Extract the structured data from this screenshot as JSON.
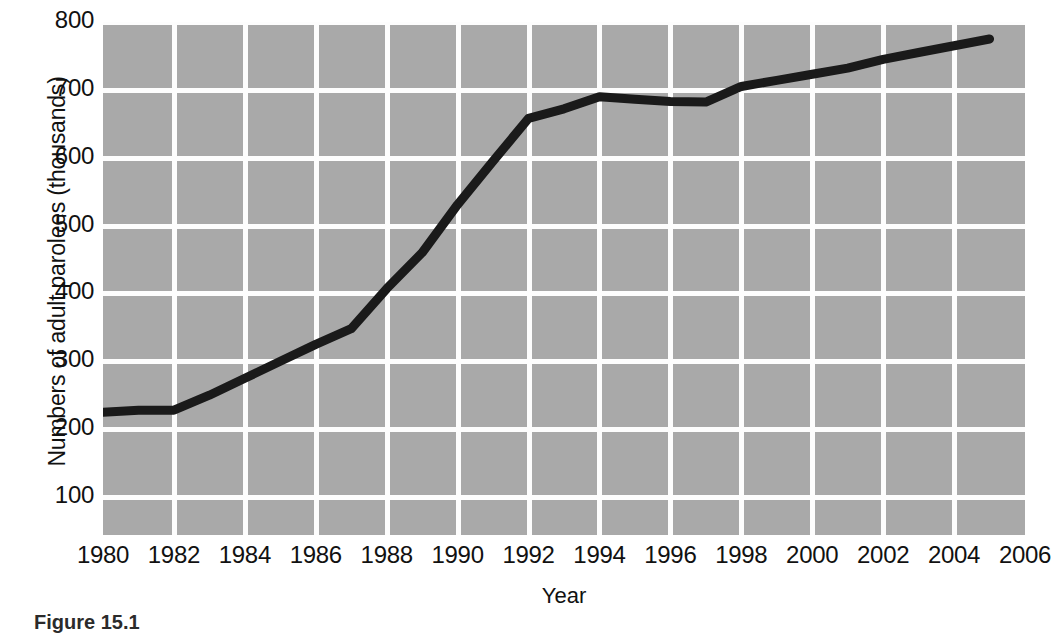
{
  "figure": {
    "caption": "Figure 15.1"
  },
  "chart_data": {
    "type": "line",
    "title": "",
    "xlabel": "Year",
    "ylabel": "Numbers of adult parolees (thousands)",
    "xlim": [
      1980,
      2006
    ],
    "ylim": [
      0,
      800
    ],
    "grid": true,
    "legend": "none",
    "xticks": [
      1980,
      1982,
      1984,
      1986,
      1988,
      1990,
      1992,
      1994,
      1996,
      1998,
      2000,
      2002,
      2004,
      2006
    ],
    "xtick_labels": [
      "1980",
      "1982",
      "1984",
      "1986",
      "1988",
      "1990",
      "1992",
      "1994",
      "1996",
      "1998",
      "2000",
      "2002",
      "2004",
      "2006"
    ],
    "yticks": [
      100,
      200,
      300,
      400,
      500,
      600,
      700,
      800
    ],
    "ytick_labels": [
      "100",
      "200",
      "300",
      "400",
      "500",
      "600",
      "700",
      "800"
    ],
    "series": [
      {
        "name": "Adult parolees",
        "color": "#1a1a1a",
        "line_width": 9,
        "x": [
          1980,
          1981,
          1982,
          1983,
          1984,
          1985,
          1986,
          1987,
          1988,
          1989,
          1990,
          1991,
          1992,
          1993,
          1994,
          1995,
          1996,
          1997,
          1998,
          1999,
          2000,
          2001,
          2002,
          2003,
          2004,
          2005
        ],
        "values": [
          225,
          228,
          228,
          250,
          275,
          300,
          325,
          348,
          407,
          460,
          531,
          595,
          658,
          672,
          690,
          686,
          683,
          682,
          705,
          714,
          723,
          732,
          745,
          755,
          765,
          775
        ]
      }
    ],
    "colors": {
      "plot_background": "#a9a9a9",
      "gridline": "#fdfdfd",
      "line": "#1a1a1a",
      "page_background": "#ffffff",
      "text": "#111111"
    }
  }
}
